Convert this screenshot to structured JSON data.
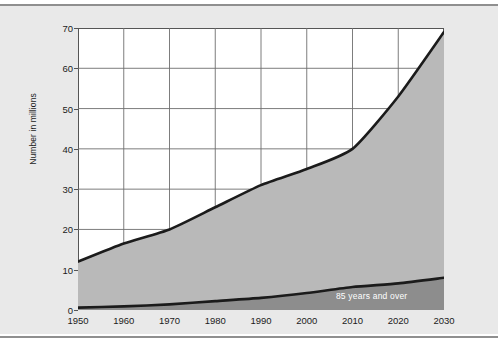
{
  "figure": {
    "background_color": "#e9e9e9",
    "plot_background_color": "#ffffff",
    "grid_color": "#6e6e6e",
    "axis_color": "#555555",
    "rule_color": "#8f8f8f"
  },
  "chart_data": {
    "type": "area",
    "title": "",
    "subtitle": "",
    "xlabel": "",
    "ylabel": "Number in millions",
    "xlim": [
      1950,
      2030
    ],
    "ylim": [
      0,
      70
    ],
    "grid": true,
    "legend_position": "inline",
    "x": [
      1950,
      1960,
      1970,
      1980,
      1990,
      2000,
      2010,
      2020,
      2030
    ],
    "xtick_labels": [
      "1950",
      "1960",
      "1970",
      "1980",
      "1990",
      "2000",
      "2010",
      "2020",
      "2030"
    ],
    "ytick_labels": [
      "0",
      "10",
      "20",
      "30",
      "40",
      "50",
      "60",
      "70"
    ],
    "yticks": [
      0,
      10,
      20,
      30,
      40,
      50,
      60,
      70
    ],
    "series": [
      {
        "name": "65 years and over",
        "inline_label": "",
        "fill_color": "#b9b9b9",
        "line_color": "#1b1b1b",
        "values": [
          12.0,
          16.5,
          20.0,
          25.5,
          31.0,
          35.0,
          40.0,
          53.0,
          69.0
        ]
      },
      {
        "name": "85 years and over",
        "inline_label": "85 years and over",
        "fill_color": "#8d8d8d",
        "line_color": "#1b1b1b",
        "values": [
          0.6,
          0.9,
          1.4,
          2.2,
          3.0,
          4.2,
          5.7,
          6.6,
          8.0
        ]
      }
    ],
    "annotations": [
      {
        "text": "85 years and over",
        "x": 2022,
        "y": 3.4,
        "color": "#ffffff"
      }
    ]
  }
}
